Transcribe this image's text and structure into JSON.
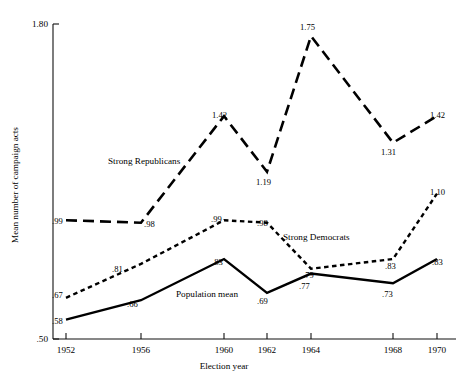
{
  "chart_data": {
    "type": "line",
    "title": "",
    "xlabel": "Election year",
    "ylabel": "Mean number of campaign acts",
    "x": [
      1952,
      1956,
      1960,
      1962,
      1964,
      1968,
      1970
    ],
    "categories": [
      "1952",
      "1956",
      "1960",
      "1962",
      "1964",
      "1968",
      "1970"
    ],
    "xlim": [
      1951,
      1971.2
    ],
    "ylim": [
      0.5,
      1.8
    ],
    "ytick_labels": [
      "1.80",
      ".50"
    ],
    "yticks": [
      1.8,
      0.5
    ],
    "grid": false,
    "legend": "inline-annotations",
    "series": [
      {
        "name": "Strong Republicans",
        "style": "long-dashed",
        "x": [
          1952,
          1956,
          1960,
          1962,
          1964,
          1968,
          1970
        ],
        "values": [
          0.99,
          0.98,
          1.42,
          1.19,
          1.75,
          1.31,
          1.42
        ],
        "labels": [
          ".99",
          ".98",
          "1.42",
          "1.19",
          "1.75",
          "1.31",
          "1.42"
        ]
      },
      {
        "name": "Strong Democrats",
        "style": "short-dashed",
        "x": [
          1952,
          1956,
          1960,
          1962,
          1964,
          1968,
          1970
        ],
        "values": [
          0.67,
          0.81,
          0.99,
          0.98,
          0.79,
          0.83,
          1.1
        ],
        "labels": [
          ".67",
          ".81",
          ".99",
          ".98",
          ".79",
          ".83",
          "1.10"
        ]
      },
      {
        "name": "Population mean",
        "style": "solid",
        "x": [
          1952,
          1956,
          1960,
          1962,
          1964,
          1968,
          1970
        ],
        "values": [
          0.58,
          0.66,
          0.83,
          0.69,
          0.77,
          0.73,
          0.83
        ],
        "labels": [
          ".58",
          ".66",
          ".83",
          ".69",
          ".77",
          ".73",
          ".83"
        ]
      }
    ],
    "annotations": [
      {
        "text": "Strong Republicans",
        "x": 1956.8,
        "y": 1.295
      },
      {
        "text": "Strong Democrats",
        "x": 1962.6,
        "y": 0.945
      },
      {
        "text": "Population mean",
        "x": 1959.5,
        "y": 0.735
      }
    ]
  },
  "axis": {
    "y_top_label": "1.80",
    "y_bottom_label": ".50",
    "y_title": "Mean number of campaign acts",
    "x_title": "Election year"
  },
  "point_labels": {
    "rep": [
      {
        "t": ".99",
        "x": 52,
        "y": 224
      },
      {
        "t": ".98",
        "x": 144,
        "y": 227
      },
      {
        "t": "1.42",
        "x": 212,
        "y": 118
      },
      {
        "t": "1.19",
        "x": 256,
        "y": 185
      },
      {
        "t": "1.75",
        "x": 300,
        "y": 30
      },
      {
        "t": "1.31",
        "x": 381,
        "y": 155
      },
      {
        "t": "1.42",
        "x": 430,
        "y": 118
      }
    ],
    "dem": [
      {
        "t": ".67",
        "x": 52,
        "y": 298
      },
      {
        "t": ".81",
        "x": 112,
        "y": 272
      },
      {
        "t": ".99",
        "x": 211,
        "y": 222
      },
      {
        "t": ".98",
        "x": 257,
        "y": 226
      },
      {
        "t": ".79",
        "x": 303,
        "y": 278
      },
      {
        "t": ".83",
        "x": 385,
        "y": 269
      },
      {
        "t": "1.10",
        "x": 430,
        "y": 195
      }
    ],
    "pop": [
      {
        "t": ".58",
        "x": 52,
        "y": 324
      },
      {
        "t": ".66",
        "x": 127,
        "y": 307
      },
      {
        "t": ".83",
        "x": 212,
        "y": 265
      },
      {
        "t": ".69",
        "x": 257,
        "y": 304
      },
      {
        "t": ".77",
        "x": 299,
        "y": 289
      },
      {
        "t": ".73",
        "x": 382,
        "y": 297
      },
      {
        "t": ".83",
        "x": 432,
        "y": 265
      }
    ]
  }
}
